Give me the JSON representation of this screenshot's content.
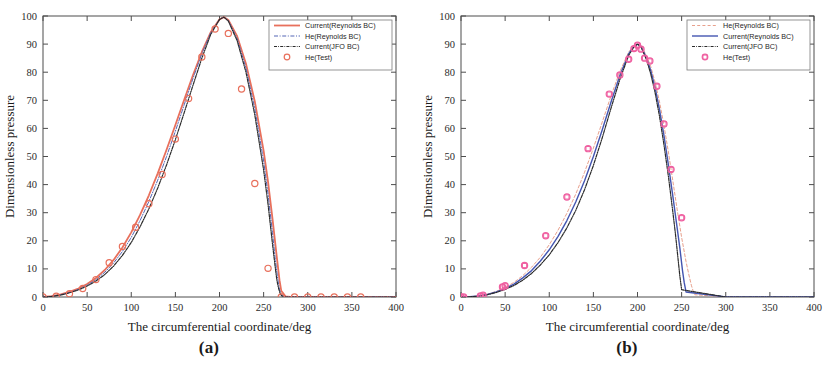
{
  "figure": {
    "panels": [
      {
        "id": "a",
        "caption": "(a)",
        "xlabel": "The circumferential coordinate/deg",
        "ylabel": "Dimensionless pressure"
      },
      {
        "id": "b",
        "caption": "(b)",
        "xlabel": "The circumferential coordinate/deg",
        "ylabel": "Dimensionless pressure"
      }
    ]
  },
  "chart_data": [
    {
      "type": "line",
      "panel": "a",
      "title": "",
      "xlabel": "The circumferential coordinate/deg",
      "ylabel": "Dimensionless pressure",
      "xlim": [
        0,
        400
      ],
      "ylim": [
        0,
        100
      ],
      "xticks": [
        0,
        50,
        100,
        150,
        200,
        250,
        300,
        350,
        400
      ],
      "yticks": [
        0,
        10,
        20,
        30,
        40,
        50,
        60,
        70,
        80,
        90,
        100
      ],
      "grid": false,
      "legend_position": "top-right",
      "series": [
        {
          "name": "Current(Reynolds BC)",
          "style": "solid",
          "color": "#e8705c",
          "width": 1.8,
          "marker": "none",
          "x": [
            0,
            10,
            20,
            30,
            40,
            50,
            60,
            70,
            80,
            90,
            100,
            110,
            120,
            130,
            140,
            150,
            160,
            170,
            180,
            190,
            200,
            205,
            210,
            220,
            230,
            240,
            250,
            255,
            260,
            265,
            268,
            270,
            275,
            280,
            300,
            330,
            360,
            400
          ],
          "y": [
            0,
            0.3,
            0.9,
            1.8,
            3.0,
            4.6,
            6.8,
            9.6,
            13.2,
            17.6,
            23.0,
            29.2,
            36.2,
            44.0,
            52.4,
            61.2,
            70.2,
            79.0,
            87.2,
            94.2,
            98.8,
            99.6,
            98.6,
            92.8,
            83.0,
            69.6,
            52.0,
            41.0,
            28.0,
            14.0,
            6.0,
            2.2,
            0.2,
            0,
            0,
            0,
            0,
            0
          ]
        },
        {
          "name": "He(Reynolds BC)",
          "style": "dash-dot",
          "color": "#5566b5",
          "width": 1.0,
          "marker": "none",
          "x": [
            0,
            10,
            20,
            30,
            40,
            50,
            60,
            70,
            80,
            90,
            100,
            110,
            120,
            130,
            140,
            150,
            160,
            170,
            180,
            190,
            200,
            205,
            210,
            220,
            230,
            240,
            250,
            255,
            260,
            263,
            266,
            268,
            270,
            275,
            300,
            330,
            360,
            400
          ],
          "y": [
            0,
            0.25,
            0.8,
            1.6,
            2.7,
            4.2,
            6.2,
            8.8,
            12.1,
            16.2,
            21.2,
            27.2,
            34.0,
            41.6,
            50.0,
            59.0,
            68.4,
            77.8,
            86.6,
            94.0,
            98.8,
            99.6,
            98.4,
            92.0,
            81.4,
            67.0,
            48.4,
            36.6,
            23.0,
            14.0,
            6.4,
            2.6,
            0.8,
            0,
            0,
            0,
            0,
            0
          ]
        },
        {
          "name": "Current(JFO BC)",
          "style": "dash-dot-dense",
          "color": "#2b2b2b",
          "width": 1.2,
          "marker": "none",
          "x": [
            0,
            10,
            20,
            30,
            40,
            50,
            60,
            70,
            80,
            90,
            100,
            110,
            120,
            130,
            140,
            150,
            160,
            170,
            180,
            190,
            200,
            205,
            210,
            220,
            230,
            240,
            250,
            255,
            260,
            263,
            265,
            267,
            269,
            272,
            300,
            330,
            360,
            400
          ],
          "y": [
            0,
            0.2,
            0.7,
            1.5,
            2.5,
            3.9,
            5.7,
            8.0,
            11.0,
            14.8,
            19.4,
            25.0,
            31.4,
            38.8,
            47.0,
            56.0,
            65.6,
            75.4,
            85.0,
            93.4,
            98.8,
            99.6,
            98.2,
            91.2,
            80.0,
            64.8,
            45.2,
            33.0,
            19.0,
            11.0,
            6.0,
            3.0,
            1.0,
            0,
            0,
            0,
            0,
            0
          ]
        },
        {
          "name": "He(Test)",
          "style": "none",
          "color": "#e8705c",
          "width": 0,
          "marker": "circle",
          "x": [
            0,
            15,
            30,
            45,
            60,
            75,
            90,
            105,
            120,
            135,
            150,
            165,
            180,
            195,
            210,
            225,
            240,
            255,
            270,
            285,
            300,
            315,
            330,
            345,
            360
          ],
          "y": [
            0,
            0.3,
            1.2,
            3.0,
            6.2,
            12.2,
            18.0,
            24.8,
            33.2,
            43.6,
            56.2,
            70.6,
            85.4,
            95.4,
            93.8,
            74.0,
            40.4,
            10.2,
            0,
            0,
            0,
            0,
            0,
            0,
            0
          ]
        }
      ]
    },
    {
      "type": "line",
      "panel": "b",
      "title": "",
      "xlabel": "The circumferential coordinate/deg",
      "ylabel": "Dimensionless pressure",
      "xlim": [
        0,
        400
      ],
      "ylim": [
        0,
        100
      ],
      "xticks": [
        0,
        50,
        100,
        150,
        200,
        250,
        300,
        350,
        400
      ],
      "yticks": [
        0,
        10,
        20,
        30,
        40,
        50,
        60,
        70,
        80,
        90,
        100
      ],
      "grid": false,
      "legend_position": "top-right",
      "series": [
        {
          "name": "He(Reynolds BC)",
          "style": "dashed",
          "color": "#e8a08c",
          "width": 1.0,
          "marker": "none",
          "x": [
            0,
            10,
            20,
            30,
            40,
            50,
            60,
            70,
            80,
            90,
            100,
            110,
            120,
            130,
            140,
            150,
            160,
            170,
            180,
            190,
            196,
            200,
            204,
            210,
            215,
            220,
            225,
            230,
            235,
            240,
            245,
            250,
            255,
            258,
            261,
            263,
            265,
            300,
            360,
            400
          ],
          "y": [
            0,
            0.1,
            0.4,
            1.0,
            2.0,
            3.4,
            5.2,
            7.6,
            10.6,
            14.2,
            18.6,
            23.8,
            29.8,
            36.6,
            44.4,
            53.0,
            62.2,
            71.6,
            80.2,
            87.2,
            89.4,
            90.0,
            89.4,
            86.0,
            82.0,
            76.4,
            69.4,
            61.0,
            51.6,
            41.4,
            31.0,
            21.2,
            12.6,
            8.2,
            4.2,
            2.2,
            0.8,
            0,
            0,
            0
          ]
        },
        {
          "name": "Current(Reynolds BC)",
          "style": "solid",
          "color": "#4455b0",
          "width": 1.4,
          "marker": "none",
          "x": [
            0,
            10,
            20,
            30,
            40,
            50,
            60,
            70,
            80,
            90,
            100,
            110,
            120,
            130,
            140,
            150,
            160,
            170,
            180,
            190,
            196,
            200,
            204,
            210,
            215,
            220,
            225,
            230,
            235,
            240,
            245,
            248,
            251,
            253,
            255,
            300,
            360,
            400
          ],
          "y": [
            0,
            0.1,
            0.35,
            0.9,
            1.8,
            3.0,
            4.6,
            6.8,
            9.4,
            12.8,
            16.8,
            21.6,
            27.2,
            33.8,
            41.4,
            50.0,
            59.4,
            69.4,
            78.8,
            86.6,
            89.2,
            90.0,
            89.2,
            85.2,
            80.6,
            74.4,
            66.6,
            57.4,
            47.0,
            36.0,
            24.4,
            17.4,
            9.4,
            5.0,
            1.8,
            0,
            0,
            0
          ]
        },
        {
          "name": "Current(JFO BC)",
          "style": "dash-dot-dense",
          "color": "#2b2b2b",
          "width": 1.2,
          "marker": "none",
          "x": [
            0,
            10,
            20,
            30,
            40,
            50,
            60,
            70,
            80,
            90,
            100,
            110,
            120,
            130,
            140,
            150,
            160,
            170,
            180,
            190,
            196,
            200,
            204,
            210,
            215,
            220,
            225,
            230,
            235,
            240,
            243,
            246,
            248,
            250,
            300,
            360,
            400
          ],
          "y": [
            0,
            0.1,
            0.3,
            0.8,
            1.6,
            2.7,
            4.1,
            6.0,
            8.4,
            11.4,
            15.0,
            19.4,
            24.6,
            30.8,
            38.2,
            46.8,
            56.6,
            67.2,
            77.4,
            86.0,
            89.0,
            90.0,
            89.0,
            84.6,
            79.4,
            72.6,
            64.2,
            54.2,
            43.0,
            30.4,
            22.4,
            13.4,
            7.4,
            2.6,
            0,
            0,
            0
          ]
        },
        {
          "name": "He(Test)",
          "style": "none",
          "color": "#ef5fa0",
          "width": 0,
          "marker": "circle-square",
          "x": [
            0,
            3,
            22,
            25,
            47,
            50,
            72,
            96,
            120,
            144,
            168,
            180,
            190,
            196,
            200,
            204,
            208,
            214,
            222,
            230,
            238,
            250
          ],
          "y": [
            0,
            0,
            0.4,
            0.6,
            3.6,
            4.0,
            11.2,
            21.8,
            35.6,
            52.8,
            72.2,
            79.0,
            84.6,
            88.4,
            89.6,
            88.2,
            85.0,
            84.0,
            75.0,
            61.6,
            45.4,
            28.2
          ]
        }
      ]
    }
  ]
}
